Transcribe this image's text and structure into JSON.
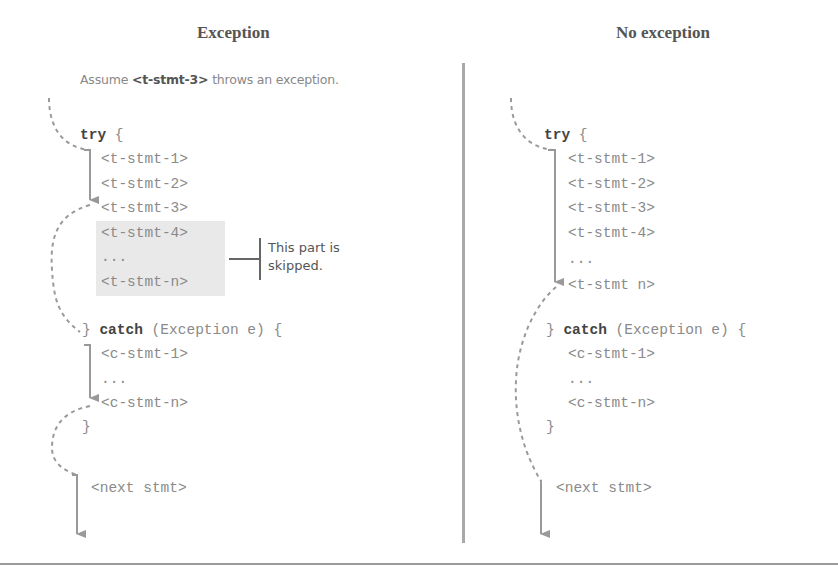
{
  "left_panel": {
    "title": "Exception",
    "note_prefix": "Assume ",
    "note_bold": "<t-stmt-3>",
    "note_suffix": " throws an exception.",
    "try_kw": "try",
    "try_brace": " {",
    "try_lines": [
      "<t-stmt-1>",
      "<t-stmt-2>",
      "<t-stmt-3>"
    ],
    "skipped_lines": [
      "<t-stmt-4>",
      "...",
      "<t-stmt-n>"
    ],
    "skipped_note_line1": "This part is",
    "skipped_note_line2": "skipped.",
    "catch_prefix": "} ",
    "catch_kw": "catch",
    "catch_suffix": " (Exception e) {",
    "catch_lines": [
      "<c-stmt-1>",
      "...",
      "<c-stmt-n>"
    ],
    "close_brace": "}",
    "next_stmt": "<next stmt>"
  },
  "right_panel": {
    "title": "No exception",
    "try_kw": "try",
    "try_brace": " {",
    "try_lines": [
      "<t-stmt-1>",
      "<t-stmt-2>",
      "<t-stmt-3>",
      "<t-stmt-4>",
      "...",
      "<t-stmt n>"
    ],
    "catch_prefix": "} ",
    "catch_kw": "catch",
    "catch_suffix": " (Exception e) {",
    "catch_lines": [
      "<c-stmt-1>",
      "...",
      "<c-stmt-n>"
    ],
    "close_brace": "}",
    "next_stmt": "<next stmt>"
  },
  "colors": {
    "arrow": "#999999",
    "dashed": "#9a9a9a",
    "shade": "#e9e9e9",
    "divider": "#a9a9a9"
  }
}
